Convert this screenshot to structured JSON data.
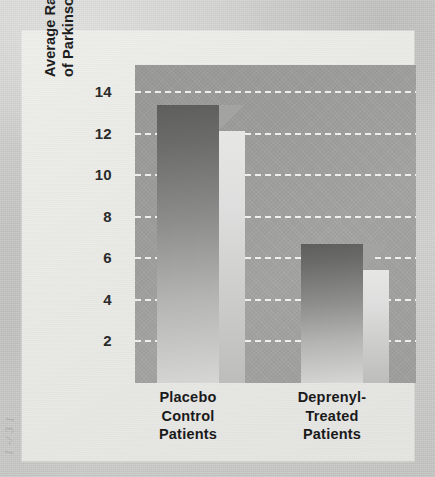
{
  "chart_data": {
    "type": "bar",
    "title": "",
    "subtitle": "",
    "xlabel": "",
    "ylabel": "Average Rate of Development of Parkinson's Motor Symptoms",
    "ylabel_lines": [
      "Average Rate of Development",
      "of Parkinson's Motor Symptoms"
    ],
    "categories": [
      "Placebo Control Patients",
      "Deprenyl-Treated Patients"
    ],
    "category_lines": [
      [
        "Placebo",
        "Control",
        "Patients"
      ],
      [
        "Deprenyl-",
        "Treated",
        "Patients"
      ]
    ],
    "values": [
      13.4,
      6.7
    ],
    "ylim": [
      0,
      15.3
    ],
    "yticks": [
      2,
      4,
      6,
      8,
      10,
      12,
      14
    ],
    "ytick_labels": [
      "2",
      "4",
      "6",
      "8",
      "10",
      "12",
      "14"
    ],
    "grid": true,
    "grid_style": "dashed-white-horizontal",
    "legend": "none",
    "style_3d": true,
    "colors": {
      "plot_background": "#9f9f9d",
      "card_background": "#e8e8e5",
      "page_background": "#c6c6c4",
      "bar_front_dark": "#5e5e5c",
      "bar_front_light": "#d6d6d4",
      "bar_side": "#dedede",
      "gridline": "#f2f2f0",
      "text": "#1a1a1a"
    }
  },
  "margin_marks": [
    "1 -/ 3 1"
  ]
}
